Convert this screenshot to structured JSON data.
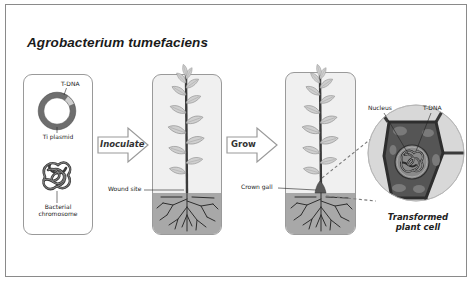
{
  "title": "Agrobacterium tumefaciens",
  "colors": {
    "frame": "#8a8a8a",
    "panel_border": "#9a9a9a",
    "soil": "#a8a8a8",
    "plasmid_ring": "#6e6e6e",
    "cell_wall": "#3a3a3a",
    "cytoplasm": "#555555",
    "halo": "#d8d8d8"
  },
  "panels": {
    "bacterium": {
      "labels": {
        "tdna": "T-DNA",
        "plasmid": "Ti plasmid",
        "chromosome_line1": "Bacterial",
        "chromosome_line2": "chromosome"
      }
    },
    "inoculated_plant": {
      "labels": {
        "wound": "Wound site"
      }
    },
    "grown_plant": {
      "labels": {
        "gall": "Crown gall"
      }
    },
    "cell_detail": {
      "labels": {
        "nucleus": "Nucleus",
        "tdna": "T-DNA",
        "caption_line1": "Transformed",
        "caption_line2": "plant cell"
      }
    }
  },
  "arrows": [
    {
      "label": "Inoculate",
      "icon": "right-arrow-icon"
    },
    {
      "label": "Grow",
      "icon": "right-arrow-icon"
    }
  ]
}
